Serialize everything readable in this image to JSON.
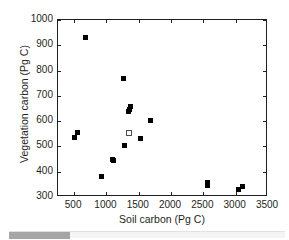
{
  "chart_data": {
    "type": "scatter",
    "title": "",
    "subtitle": "",
    "xlabel": "Soil carbon (Pg C)",
    "ylabel": "Vegetation carbon (Pg C)",
    "xlim": [
      250,
      3500
    ],
    "ylim": [
      300,
      1000
    ],
    "xticks": [
      500,
      1000,
      1500,
      2000,
      2500,
      3000,
      3500
    ],
    "xticklabels": [
      "500",
      "1000",
      "1500",
      "2000",
      "2500",
      "3000",
      "3500"
    ],
    "yticks": [
      300,
      400,
      500,
      600,
      700,
      800,
      900,
      1000
    ],
    "yticklabels": [
      "300",
      "400",
      "500",
      "600",
      "700",
      "800",
      "900",
      "1000"
    ],
    "grid": false,
    "legend": null,
    "annotations": [],
    "series": [
      {
        "name": "models",
        "marker": "filled-square",
        "color": "#000000",
        "points": [
          {
            "x": 510,
            "y": 535
          },
          {
            "x": 545,
            "y": 555
          },
          {
            "x": 680,
            "y": 930
          },
          {
            "x": 925,
            "y": 380
          },
          {
            "x": 1090,
            "y": 450
          },
          {
            "x": 1110,
            "y": 443
          },
          {
            "x": 1260,
            "y": 768
          },
          {
            "x": 1275,
            "y": 502
          },
          {
            "x": 1340,
            "y": 637
          },
          {
            "x": 1350,
            "y": 645
          },
          {
            "x": 1375,
            "y": 658
          },
          {
            "x": 1530,
            "y": 532
          },
          {
            "x": 1680,
            "y": 604
          },
          {
            "x": 2560,
            "y": 345
          },
          {
            "x": 2570,
            "y": 357
          },
          {
            "x": 3050,
            "y": 331
          },
          {
            "x": 3100,
            "y": 343
          }
        ]
      },
      {
        "name": "observation",
        "marker": "open-square",
        "color": "#ffffff",
        "points": [
          {
            "x": 1355,
            "y": 555
          }
        ]
      }
    ]
  },
  "axis": {
    "x_title": "Soil carbon (Pg C)",
    "y_title": "Vegetation carbon (Pg C)"
  },
  "scrollbar": {
    "orientation": "horizontal",
    "thumb_position_percent": 0,
    "thumb_width_percent": 22
  }
}
